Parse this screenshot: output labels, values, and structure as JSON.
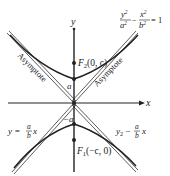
{
  "diagram": {
    "equation": {
      "lhs_num1": "y",
      "lhs_exp1": "2",
      "lhs_den1": "a",
      "lhs_den_exp1": "2",
      "minus": "−",
      "lhs_num2": "x",
      "lhs_exp2": "2",
      "lhs_den2": "b",
      "lhs_den_exp2": "2",
      "rhs": "= 1"
    },
    "axes": {
      "x_label": "x",
      "y_label": "y"
    },
    "points": {
      "focus_upper": {
        "name": "F",
        "sub": "2",
        "coords": "(0, c)"
      },
      "focus_lower": {
        "name": "F",
        "sub": "1",
        "coords": "(−c, 0)"
      },
      "vertex_upper": "a",
      "vertex_lower": "−a"
    },
    "asymptote_labels": {
      "left": "Asymptote",
      "right": "Asymptote"
    },
    "asymptote_equations": {
      "left": {
        "prefix": "y = ",
        "num": "a",
        "den": "b",
        "suffix": "x"
      },
      "right": {
        "prefix": "y",
        "sub": "2",
        "op": " − ",
        "num": "a",
        "den": "b",
        "suffix": "x"
      }
    },
    "colors": {
      "curve": "#222222",
      "axis": "#222222",
      "asymptote": "#333333"
    }
  }
}
